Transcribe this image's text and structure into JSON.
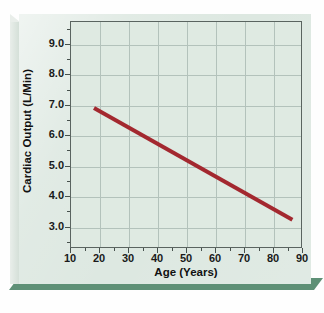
{
  "figure": {
    "name": "cardiac-output-vs-age",
    "card_background": "#dde8e1",
    "card_shadow": "#5e9076",
    "plot_background": "#dfeae2",
    "frame_color": "#5a6460",
    "grid_color": "#b3c2bb"
  },
  "chart_data": {
    "type": "line",
    "title": "",
    "xlabel": "Age (Years)",
    "ylabel": "Cardiac Output (L/Min)",
    "xlim": [
      10,
      90
    ],
    "ylim": [
      2.3,
      9.75
    ],
    "grid": true,
    "legend": null,
    "xticks": [
      10,
      20,
      30,
      40,
      50,
      60,
      70,
      80,
      90
    ],
    "xtick_labels": [
      "10",
      "20",
      "30",
      "40",
      "50",
      "60",
      "70",
      "80",
      "90"
    ],
    "yticks": [
      3.0,
      4.0,
      5.0,
      6.0,
      7.0,
      8.0,
      9.0
    ],
    "ytick_labels": [
      "3.0",
      "4.0",
      "5.0",
      "6.0",
      "7.0",
      "8.0",
      "9.0"
    ],
    "x_minor_step": 5,
    "y_minor_step": 0.5,
    "series": [
      {
        "name": "cardiac-output",
        "color": "#a3282f",
        "line_width": 4,
        "x": [
          18,
          87
        ],
        "values": [
          6.9,
          3.2
        ]
      }
    ]
  }
}
